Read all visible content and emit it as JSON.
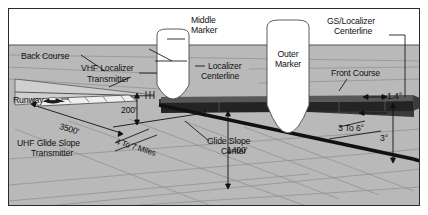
{
  "diagram": {
    "type": "technical-illustration",
    "colors": {
      "ground": "#b9b9b9",
      "sky": "#ffffff",
      "beam_dark": "#2b2b2b",
      "beam_mid": "#6f6f6f",
      "line": "#1a1a1a",
      "frame": "#2a2a2a"
    }
  },
  "labels": {
    "back_course": "Back Course",
    "vhf_localizer": "VHF Localizer",
    "transmitter": "Transmitter",
    "runway": "Runway",
    "uhf_glide_slope": "UHF Glide Slope",
    "uhf_transmitter": "Transmitter",
    "middle_marker_l1": "Middle",
    "middle_marker_l2": "Marker",
    "outer_marker_l1": "Outer",
    "outer_marker_l2": "Marker",
    "localizer_centerline_l1": "Localizer",
    "localizer_centerline_l2": "Centerline",
    "gs_localizer_l1": "GS/Localizer",
    "gs_localizer_l2": "Centerline",
    "front_course": "Front Course",
    "glide_slope_center_l1": "Glide Slope",
    "glide_slope_center_l2": "Center"
  },
  "dimensions": {
    "runway_length": "3500'",
    "decision_height": "200'",
    "outer_marker_alt": "1400'",
    "distance_range": "4 To 7 Miles"
  },
  "angles": {
    "localizer_width": "1.4°",
    "glide_slope_range": "3 To 6°",
    "glide_slope_nominal": "3°"
  }
}
